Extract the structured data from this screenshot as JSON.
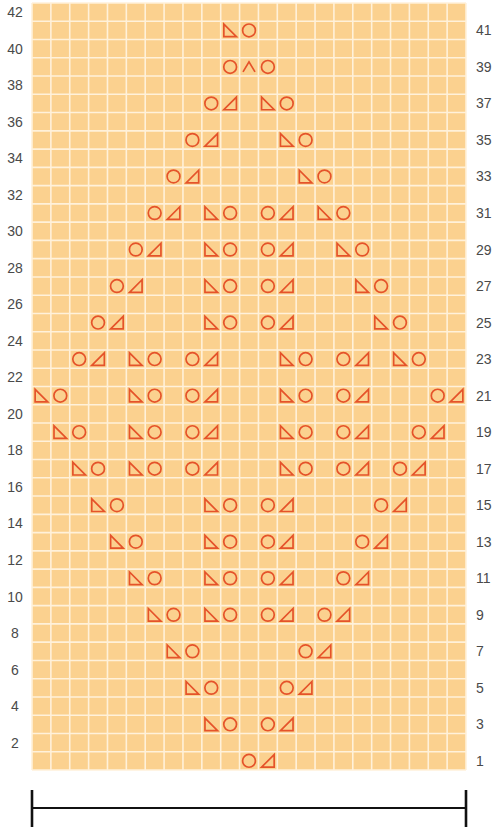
{
  "chart_data": {
    "type": "knitting-chart",
    "title": "",
    "rows": 42,
    "columns": 23,
    "colors": {
      "cell_fill": "#FBD18F",
      "grid_line": "#FFF1DA",
      "symbol": "#E5532A",
      "label": "#4a4a4a",
      "bracket": "#111111"
    },
    "left_labels": [
      "2",
      "4",
      "6",
      "8",
      "10",
      "12",
      "14",
      "16",
      "18",
      "20",
      "22",
      "24",
      "26",
      "28",
      "30",
      "32",
      "34",
      "36",
      "38",
      "40",
      "42"
    ],
    "right_labels": [
      "1",
      "3",
      "5",
      "7",
      "9",
      "11",
      "13",
      "15",
      "17",
      "19",
      "21",
      "23",
      "25",
      "27",
      "29",
      "31",
      "33",
      "35",
      "37",
      "39",
      "41"
    ],
    "legend_symbols": {
      "O": "yarn-over (circle)",
      "L": "left-leaning triangle (ssk-type decrease)",
      "R": "right-leaning triangle (k2tog-type decrease)",
      "A": "double decrease (caret)"
    },
    "symbols": [
      {
        "row": 41,
        "items": [
          [
            11,
            "L"
          ],
          [
            12,
            "O"
          ]
        ]
      },
      {
        "row": 39,
        "items": [
          [
            11,
            "O"
          ],
          [
            12,
            "A"
          ],
          [
            13,
            "O"
          ]
        ]
      },
      {
        "row": 37,
        "items": [
          [
            10,
            "O"
          ],
          [
            11,
            "R"
          ],
          [
            13,
            "L"
          ],
          [
            14,
            "O"
          ]
        ]
      },
      {
        "row": 35,
        "items": [
          [
            9,
            "O"
          ],
          [
            10,
            "R"
          ],
          [
            14,
            "L"
          ],
          [
            15,
            "O"
          ]
        ]
      },
      {
        "row": 33,
        "items": [
          [
            8,
            "O"
          ],
          [
            9,
            "R"
          ],
          [
            15,
            "L"
          ],
          [
            16,
            "O"
          ]
        ]
      },
      {
        "row": 31,
        "items": [
          [
            7,
            "O"
          ],
          [
            8,
            "R"
          ],
          [
            10,
            "L"
          ],
          [
            11,
            "O"
          ],
          [
            13,
            "O"
          ],
          [
            14,
            "R"
          ],
          [
            16,
            "L"
          ],
          [
            17,
            "O"
          ]
        ]
      },
      {
        "row": 29,
        "items": [
          [
            6,
            "O"
          ],
          [
            7,
            "R"
          ],
          [
            10,
            "L"
          ],
          [
            11,
            "O"
          ],
          [
            13,
            "O"
          ],
          [
            14,
            "R"
          ],
          [
            17,
            "L"
          ],
          [
            18,
            "O"
          ]
        ]
      },
      {
        "row": 27,
        "items": [
          [
            5,
            "O"
          ],
          [
            6,
            "R"
          ],
          [
            10,
            "L"
          ],
          [
            11,
            "O"
          ],
          [
            13,
            "O"
          ],
          [
            14,
            "R"
          ],
          [
            18,
            "L"
          ],
          [
            19,
            "O"
          ]
        ]
      },
      {
        "row": 25,
        "items": [
          [
            4,
            "O"
          ],
          [
            5,
            "R"
          ],
          [
            10,
            "L"
          ],
          [
            11,
            "O"
          ],
          [
            13,
            "O"
          ],
          [
            14,
            "R"
          ],
          [
            19,
            "L"
          ],
          [
            20,
            "O"
          ]
        ]
      },
      {
        "row": 23,
        "items": [
          [
            3,
            "O"
          ],
          [
            4,
            "R"
          ],
          [
            6,
            "L"
          ],
          [
            7,
            "O"
          ],
          [
            9,
            "O"
          ],
          [
            10,
            "R"
          ],
          [
            14,
            "L"
          ],
          [
            15,
            "O"
          ],
          [
            17,
            "O"
          ],
          [
            18,
            "R"
          ],
          [
            20,
            "L"
          ],
          [
            21,
            "O"
          ]
        ]
      },
      {
        "row": 21,
        "items": [
          [
            1,
            "L"
          ],
          [
            2,
            "O"
          ],
          [
            6,
            "L"
          ],
          [
            7,
            "O"
          ],
          [
            9,
            "O"
          ],
          [
            10,
            "R"
          ],
          [
            14,
            "L"
          ],
          [
            15,
            "O"
          ],
          [
            17,
            "O"
          ],
          [
            18,
            "R"
          ],
          [
            22,
            "O"
          ],
          [
            23,
            "R"
          ]
        ]
      },
      {
        "row": 19,
        "items": [
          [
            2,
            "L"
          ],
          [
            3,
            "O"
          ],
          [
            6,
            "L"
          ],
          [
            7,
            "O"
          ],
          [
            9,
            "O"
          ],
          [
            10,
            "R"
          ],
          [
            14,
            "L"
          ],
          [
            15,
            "O"
          ],
          [
            17,
            "O"
          ],
          [
            18,
            "R"
          ],
          [
            21,
            "O"
          ],
          [
            22,
            "R"
          ]
        ]
      },
      {
        "row": 17,
        "items": [
          [
            3,
            "L"
          ],
          [
            4,
            "O"
          ],
          [
            6,
            "L"
          ],
          [
            7,
            "O"
          ],
          [
            9,
            "O"
          ],
          [
            10,
            "R"
          ],
          [
            14,
            "L"
          ],
          [
            15,
            "O"
          ],
          [
            17,
            "O"
          ],
          [
            18,
            "R"
          ],
          [
            20,
            "O"
          ],
          [
            21,
            "R"
          ]
        ]
      },
      {
        "row": 15,
        "items": [
          [
            4,
            "L"
          ],
          [
            5,
            "O"
          ],
          [
            10,
            "L"
          ],
          [
            11,
            "O"
          ],
          [
            13,
            "O"
          ],
          [
            14,
            "R"
          ],
          [
            19,
            "O"
          ],
          [
            20,
            "R"
          ]
        ]
      },
      {
        "row": 13,
        "items": [
          [
            5,
            "L"
          ],
          [
            6,
            "O"
          ],
          [
            10,
            "L"
          ],
          [
            11,
            "O"
          ],
          [
            13,
            "O"
          ],
          [
            14,
            "R"
          ],
          [
            18,
            "O"
          ],
          [
            19,
            "R"
          ]
        ]
      },
      {
        "row": 11,
        "items": [
          [
            6,
            "L"
          ],
          [
            7,
            "O"
          ],
          [
            10,
            "L"
          ],
          [
            11,
            "O"
          ],
          [
            13,
            "O"
          ],
          [
            14,
            "R"
          ],
          [
            17,
            "O"
          ],
          [
            18,
            "R"
          ]
        ]
      },
      {
        "row": 9,
        "items": [
          [
            7,
            "L"
          ],
          [
            8,
            "O"
          ],
          [
            10,
            "L"
          ],
          [
            11,
            "O"
          ],
          [
            13,
            "O"
          ],
          [
            14,
            "R"
          ],
          [
            16,
            "O"
          ],
          [
            17,
            "R"
          ]
        ]
      },
      {
        "row": 7,
        "items": [
          [
            8,
            "L"
          ],
          [
            9,
            "O"
          ],
          [
            15,
            "O"
          ],
          [
            16,
            "R"
          ]
        ]
      },
      {
        "row": 5,
        "items": [
          [
            9,
            "L"
          ],
          [
            10,
            "O"
          ],
          [
            14,
            "O"
          ],
          [
            15,
            "R"
          ]
        ]
      },
      {
        "row": 3,
        "items": [
          [
            10,
            "L"
          ],
          [
            11,
            "O"
          ],
          [
            13,
            "O"
          ],
          [
            14,
            "R"
          ]
        ]
      },
      {
        "row": 1,
        "items": [
          [
            12,
            "O"
          ],
          [
            13,
            "R"
          ]
        ]
      }
    ],
    "repeat_bracket": {
      "from_column": 1,
      "to_column": 23
    }
  }
}
